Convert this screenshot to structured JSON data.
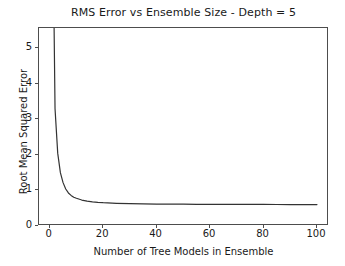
{
  "chart_data": {
    "type": "line",
    "title": "RMS Error vs Ensemble Size - Depth = 5",
    "xlabel": "Number of Tree Models in Ensemble",
    "ylabel": "Root Mean Squared Error",
    "xlim": [
      -4.0,
      104.5
    ],
    "ylim": [
      0.0,
      5.57
    ],
    "xticks": [
      0,
      20,
      40,
      60,
      80,
      100
    ],
    "xtick_labels": [
      "0",
      "20",
      "40",
      "60",
      "80",
      "100"
    ],
    "yticks": [
      0,
      1,
      2,
      3,
      4,
      5
    ],
    "ytick_labels": [
      "0",
      "1",
      "2",
      "3",
      "4",
      "5"
    ],
    "grid": false,
    "legend": null,
    "line_color": "#333333",
    "line_width": 1.2,
    "series": [
      {
        "name": "RMSE",
        "note": "First point is clipped above the top of the axes; curve decays rapidly and flattens near 0.60",
        "x": [
          1,
          2,
          3,
          4,
          5,
          6,
          7,
          8,
          9,
          10,
          12,
          14,
          16,
          18,
          20,
          25,
          30,
          35,
          40,
          45,
          50,
          55,
          60,
          65,
          70,
          75,
          80,
          85,
          90,
          95,
          100
        ],
        "y": [
          9.8,
          3.3,
          2.05,
          1.5,
          1.22,
          1.04,
          0.93,
          0.86,
          0.81,
          0.78,
          0.73,
          0.7,
          0.68,
          0.665,
          0.655,
          0.638,
          0.628,
          0.622,
          0.618,
          0.615,
          0.613,
          0.611,
          0.61,
          0.609,
          0.608,
          0.607,
          0.606,
          0.605,
          0.604,
          0.604,
          0.603
        ]
      }
    ]
  },
  "axes": {
    "spine_color": "#4d4d4d",
    "background": "#ffffff"
  }
}
